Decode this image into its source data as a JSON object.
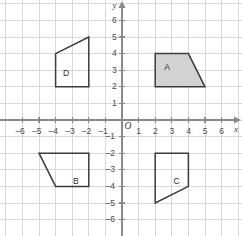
{
  "chart_data": {
    "type": "scatter",
    "title": "",
    "xlabel": "x",
    "ylabel": "y",
    "xlim": [
      -7.2,
      7.2
    ],
    "ylim": [
      -7.2,
      7.2
    ],
    "grid": true,
    "legend": "none",
    "origin_label": "O",
    "x_ticks": [
      -6,
      -5,
      -4,
      -3,
      -2,
      -1,
      1,
      2,
      3,
      4,
      5,
      6
    ],
    "y_ticks": [
      6,
      5,
      4,
      3,
      2,
      1,
      -1,
      -2,
      -3,
      -4,
      -5,
      -6
    ],
    "x_tick_labels": [
      "–6",
      "–5",
      "–4",
      "–3",
      "–2",
      "–1",
      "1",
      "2",
      "3",
      "4",
      "5",
      "6"
    ],
    "y_tick_labels": [
      "6",
      "5",
      "4",
      "3",
      "2",
      "1",
      "–1",
      "–2",
      "–3",
      "–4",
      "–5",
      "–6"
    ],
    "shapes": [
      {
        "name": "A",
        "label": "A",
        "label_point": [
          2.55,
          3.45
        ],
        "vertices": [
          [
            2,
            2
          ],
          [
            2,
            4
          ],
          [
            4,
            4
          ],
          [
            5,
            2
          ]
        ],
        "fill": "#d2d2d2",
        "stroke": "#3c3c3c",
        "filled": true
      },
      {
        "name": "B",
        "label": "B",
        "label_point": [
          -2.95,
          -3.45
        ],
        "vertices": [
          [
            -5,
            -2
          ],
          [
            -2,
            -2
          ],
          [
            -2,
            -4
          ],
          [
            -4,
            -4
          ]
        ],
        "fill": "none",
        "stroke": "#3c3c3c",
        "filled": false
      },
      {
        "name": "C",
        "label": "C",
        "label_point": [
          3.1,
          -3.45
        ],
        "vertices": [
          [
            2,
            -2
          ],
          [
            4,
            -2
          ],
          [
            4,
            -4
          ],
          [
            2,
            -5
          ]
        ],
        "fill": "none",
        "stroke": "#3c3c3c",
        "filled": false
      },
      {
        "name": "D",
        "label": "D",
        "label_point": [
          -3.55,
          3.05
        ],
        "vertices": [
          [
            -4,
            2
          ],
          [
            -4,
            4
          ],
          [
            -2,
            5
          ],
          [
            -2,
            2
          ]
        ],
        "fill": "none",
        "stroke": "#3c3c3c",
        "filled": false
      }
    ]
  },
  "colors": {
    "grid_line": "#d8d8d8",
    "axis_line": "#8a8a8a",
    "shape_stroke": "#3c3c3c",
    "shape_fill": "#d2d2d2",
    "text": "#3a3a3a",
    "background": "#ffffff"
  }
}
